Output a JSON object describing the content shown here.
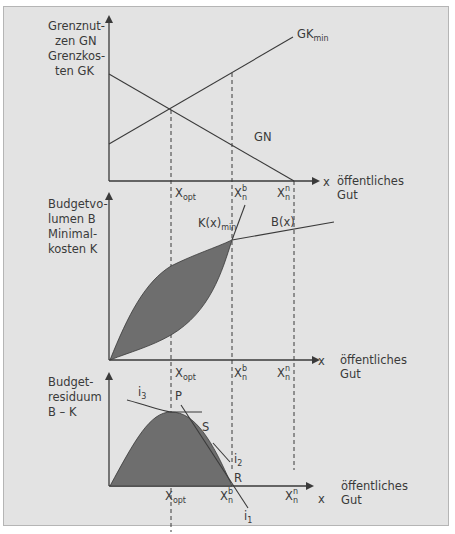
{
  "panel_top": {
    "ylabel_lines": [
      "Grenznut-",
      "zen GN",
      "Grenzkos-",
      "ten GK"
    ],
    "curve_gk": {
      "label": "GK",
      "sub": "min"
    },
    "curve_gn": {
      "label": "GN"
    },
    "x_axis": {
      "label": "x",
      "caption_lines": [
        "öffentliches",
        "Gut"
      ]
    },
    "ticks": [
      {
        "main": "X",
        "sub": "opt",
        "sup": ""
      },
      {
        "main": "X",
        "sub": "n",
        "sup": "b"
      },
      {
        "main": "X",
        "sub": "n",
        "sup": "n"
      }
    ]
  },
  "panel_middle": {
    "ylabel_lines": [
      "Budgetvo-",
      "lumen B",
      "Minimal-",
      "kosten K"
    ],
    "curve_k": {
      "label": "K(x)",
      "sub": "min"
    },
    "curve_b": {
      "label": "B(x)"
    },
    "x_axis": {
      "label": "x",
      "caption_lines": [
        "öffentliches",
        "Gut"
      ]
    },
    "ticks": [
      {
        "main": "X",
        "sub": "opt",
        "sup": ""
      },
      {
        "main": "X",
        "sub": "n",
        "sup": "b"
      },
      {
        "main": "X",
        "sub": "n",
        "sup": "n"
      }
    ]
  },
  "panel_bottom": {
    "ylabel_lines": [
      "Budget-",
      "residuum",
      "B – K"
    ],
    "points": {
      "P": "P",
      "S": "S",
      "R": "R"
    },
    "tangents": [
      {
        "label": "i",
        "sub": "3"
      },
      {
        "label": "i",
        "sub": "2"
      },
      {
        "label": "i",
        "sub": "1"
      }
    ],
    "x_axis": {
      "label": "x",
      "caption_lines": [
        "öffentliches",
        "Gut"
      ]
    },
    "ticks": [
      {
        "main": "X",
        "sub": "opt",
        "sup": ""
      },
      {
        "main": "X",
        "sub": "n",
        "sup": "b"
      },
      {
        "main": "X",
        "sub": "n",
        "sup": "n"
      }
    ]
  },
  "colors": {
    "background": "#e3e3e3",
    "line": "#3a3a3a",
    "fill": "#6e6e6e"
  }
}
